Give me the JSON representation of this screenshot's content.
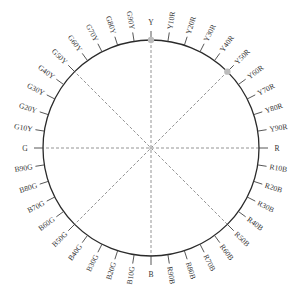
{
  "diagram": {
    "type": "NCS hue circle",
    "center": [
      151,
      148
    ],
    "radius": 108,
    "colors": {
      "circle": "#2a2a2a",
      "tick": "#444444",
      "dashed": "#888888",
      "dot": "#bbbbbb",
      "label": "#333333"
    },
    "labels": [
      "Y",
      "Y10R",
      "Y20R",
      "Y30R",
      "Y40R",
      "Y50R",
      "Y60R",
      "Y70R",
      "Y80R",
      "Y90R",
      "R",
      "R10B",
      "R20B",
      "R30B",
      "R40B",
      "R50B",
      "R60B",
      "R70B",
      "R80B",
      "R90B",
      "B",
      "B10G",
      "B20G",
      "B30G",
      "B40G",
      "B50G",
      "B60G",
      "B70G",
      "B80G",
      "B90G",
      "G",
      "G10Y",
      "G20Y",
      "G30Y",
      "G40Y",
      "G50Y",
      "G60Y",
      "G70Y",
      "G80Y",
      "G90Y"
    ],
    "axes": [
      {
        "from": "Y",
        "to": "B"
      },
      {
        "from": "R",
        "to": "G"
      },
      {
        "from": "Y50R",
        "to": "B50G"
      },
      {
        "from": "R50B",
        "to": "G50Y"
      }
    ],
    "highlighted_points": [
      "Y",
      "Y50R"
    ]
  }
}
